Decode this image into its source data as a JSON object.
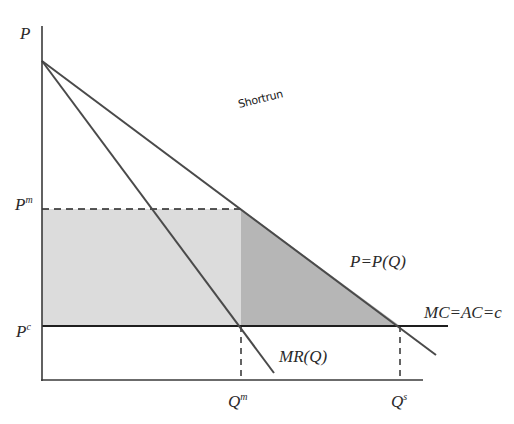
{
  "diagram": {
    "type": "monopoly-deadweight-loss",
    "annotation": "Shortrun",
    "axes": {
      "y_label": "P",
      "x_label": ""
    },
    "price_labels": {
      "monopoly": {
        "base": "P",
        "sup": "m"
      },
      "competitive": {
        "base": "P",
        "sup": "c"
      }
    },
    "quantity_labels": {
      "monopoly": {
        "base": "Q",
        "sup": "m"
      },
      "social": {
        "base": "Q",
        "sup": "s"
      }
    },
    "curves": {
      "demand": "P=P(Q)",
      "marginal_revenue": "MR(Q)",
      "cost": "MC=AC=c"
    },
    "regions": {
      "monopoly_profit": {
        "color": "#dcdcdc"
      },
      "deadweight_loss": {
        "color": "#b4b4b4"
      }
    },
    "colors": {
      "line": "#4a4a4a",
      "axis": "#3a3a3a",
      "dashed": "#222222"
    }
  }
}
